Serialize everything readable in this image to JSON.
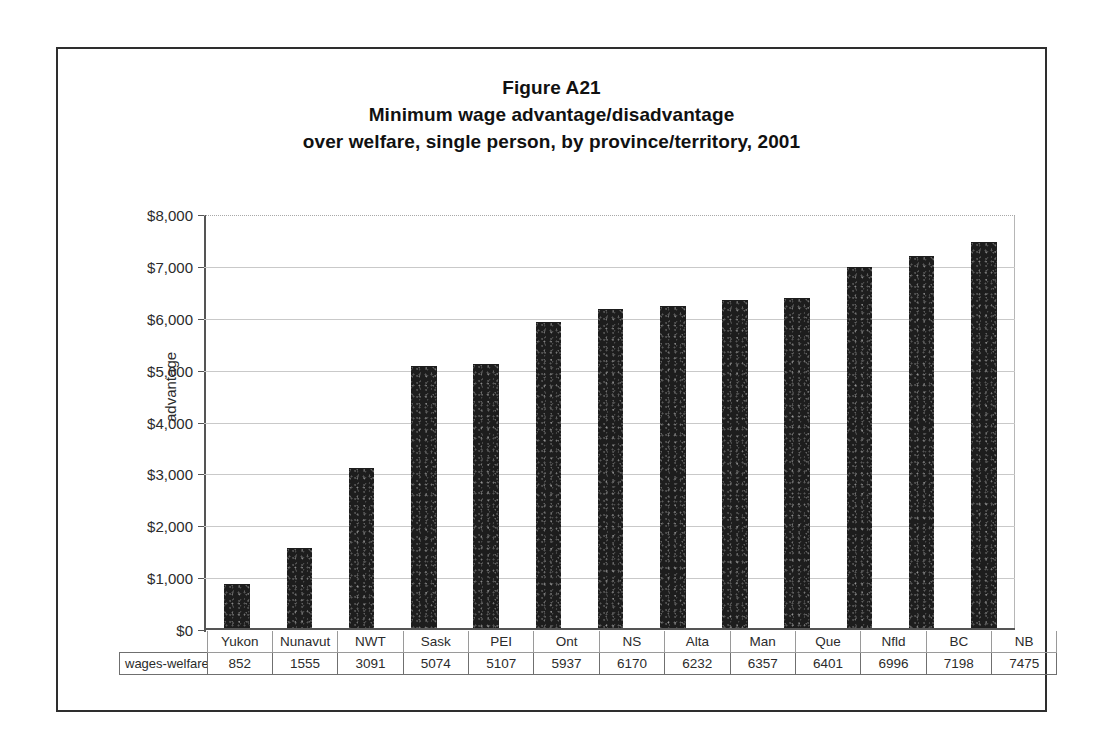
{
  "figure": {
    "title_lines": [
      "Figure A21",
      "Minimum wage advantage/disadvantage",
      "over welfare, single person, by province/territory, 2001"
    ]
  },
  "axis": {
    "y_title": "advantage",
    "y_ticks": [
      "$8,000",
      "$7,000",
      "$6,000",
      "$5,000",
      "$4,000",
      "$3,000",
      "$2,000",
      "$1,000",
      "$0"
    ]
  },
  "table": {
    "row_label": "wages-welfare"
  },
  "chart_data": {
    "type": "bar",
    "xlabel": "",
    "ylabel": "advantage",
    "ylim": [
      0,
      8000
    ],
    "ytick_step": 1000,
    "grid": true,
    "legend": false,
    "series_name": "wages-welfare",
    "categories": [
      "Yukon",
      "Nunavut",
      "NWT",
      "Sask",
      "PEI",
      "Ont",
      "NS",
      "Alta",
      "Man",
      "Que",
      "Nfld",
      "BC",
      "NB"
    ],
    "values": [
      852,
      1555,
      3091,
      5074,
      5107,
      5937,
      6170,
      6232,
      6357,
      6401,
      6996,
      7198,
      7475
    ],
    "value_labels": [
      "852",
      "1555",
      "3091",
      "5074",
      "5107",
      "5937",
      "6170",
      "6232",
      "6357",
      "6401",
      "6996",
      "7198",
      "7475"
    ],
    "bar_color": "#1d1d1d"
  }
}
